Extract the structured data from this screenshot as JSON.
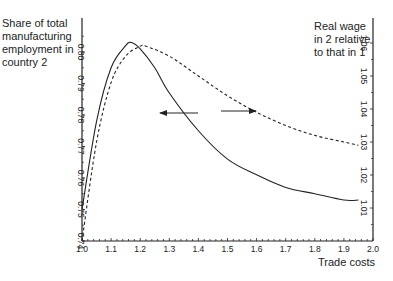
{
  "chart_data": {
    "type": "line",
    "title": "",
    "xlabel": "Trade costs",
    "ylabel_left": "Share of total manufacturing employment in country 2",
    "ylabel_right": "Real wage in 2 relative to that in 1",
    "xlim": [
      1.0,
      2.0
    ],
    "ylim_left": [
      0.74,
      0.81
    ],
    "ylim_right": [
      1.0,
      1.065
    ],
    "x_ticks": [
      "1.0",
      "1.1",
      "1.2",
      "1.3",
      "1.4",
      "1.5",
      "1.6",
      "1.7",
      "1.8",
      "1.9",
      "2.0"
    ],
    "y_ticks_left": [
      "0.74",
      "0.75",
      "0.76",
      "0.77",
      "0.78",
      "0.79",
      "0.80"
    ],
    "y_ticks_right": [
      "1.01",
      "1.02",
      "1.03",
      "1.04",
      "1.05",
      "1.06"
    ],
    "grid": false,
    "series": [
      {
        "name": "Share of total manufacturing employment in country 2",
        "axis": "left",
        "style": "solid",
        "x": [
          1.0,
          1.05,
          1.1,
          1.15,
          1.17,
          1.2,
          1.25,
          1.3,
          1.4,
          1.5,
          1.6,
          1.7,
          1.8,
          1.9,
          1.95
        ],
        "y": [
          0.75,
          0.778,
          0.795,
          0.802,
          0.803,
          0.801,
          0.795,
          0.787,
          0.775,
          0.766,
          0.761,
          0.757,
          0.755,
          0.753,
          0.753
        ]
      },
      {
        "name": "Real wage in 2 relative to that in 1",
        "axis": "right",
        "style": "dashed",
        "x": [
          1.0,
          1.05,
          1.1,
          1.15,
          1.2,
          1.22,
          1.3,
          1.4,
          1.5,
          1.6,
          1.7,
          1.8,
          1.9,
          1.95
        ],
        "y": [
          1.0,
          1.03,
          1.048,
          1.056,
          1.059,
          1.059,
          1.056,
          1.05,
          1.044,
          1.039,
          1.035,
          1.032,
          1.03,
          1.029
        ]
      }
    ],
    "annotations": [
      {
        "type": "arrow",
        "direction": "left",
        "meaning": "solid curve reads left axis"
      },
      {
        "type": "arrow",
        "direction": "right",
        "meaning": "dashed curve reads right axis"
      }
    ]
  },
  "labels": {
    "ylabel_left": "Share of total manufacturing employment in country 2",
    "ylabel_right": "Real wage in 2 relative to that in 1",
    "xlabel": "Trade costs"
  }
}
